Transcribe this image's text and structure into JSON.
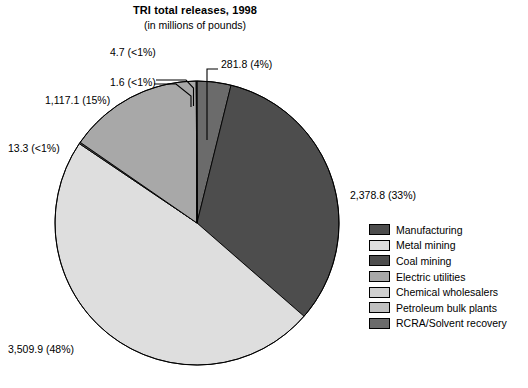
{
  "header": {
    "title": "TRI total releases, 1998",
    "subtitle": "(in millions of pounds)"
  },
  "legend": {
    "items": [
      {
        "label": "Manufacturing",
        "color": "#4d4d4d"
      },
      {
        "label": "Metal mining",
        "color": "#dedede"
      },
      {
        "label": "Coal mining",
        "color": "#4d4d4d"
      },
      {
        "label": "Electric utilities",
        "color": "#a8a8a8"
      },
      {
        "label": "Chemical wholesalers",
        "color": "#d0d0d0"
      },
      {
        "label": "Petroleum bulk plants",
        "color": "#c0c0c0"
      },
      {
        "label": "RCRA/Solvent recovery",
        "color": "#6b6b6b"
      }
    ]
  },
  "labels": {
    "manufacturing": "2,378.8 (33%)",
    "metal_mining": "3,509.9 (48%)",
    "coal_mining": "13.3 (<1%)",
    "electric_utilities": "1,117.1 (15%)",
    "chemical_wholesalers": "1.6 (<1%)",
    "petroleum_bulk_plants": "4.7 (<1%)",
    "rcra_solvent_recovery": "281.8 (4%)"
  },
  "chart_data": {
    "type": "pie",
    "title": "TRI total releases, 1998",
    "subtitle": "(in millions of pounds)",
    "unit": "millions of pounds",
    "categories": [
      "Manufacturing",
      "Metal mining",
      "Coal mining",
      "Electric utilities",
      "Chemical wholesalers",
      "Petroleum bulk plants",
      "RCRA/Solvent recovery"
    ],
    "values": [
      2378.8,
      3509.9,
      13.3,
      1117.1,
      1.6,
      4.7,
      281.8
    ],
    "percent_labels": [
      "33%",
      "48%",
      "<1%",
      "15%",
      "<1%",
      "<1%",
      "4%"
    ],
    "data_labels": [
      "2,378.8 (33%)",
      "3,509.9 (48%)",
      "13.3 (<1%)",
      "1,117.1 (15%)",
      "1.6 (<1%)",
      "4.7 (<1%)",
      "281.8 (4%)"
    ],
    "colors": [
      "#4d4d4d",
      "#dedede",
      "#4d4d4d",
      "#a8a8a8",
      "#d0d0d0",
      "#c0c0c0",
      "#6b6b6b"
    ],
    "total": 7307.2,
    "start_angle_deg": 0,
    "direction": "clockwise",
    "legend_position": "right",
    "grid": false
  }
}
